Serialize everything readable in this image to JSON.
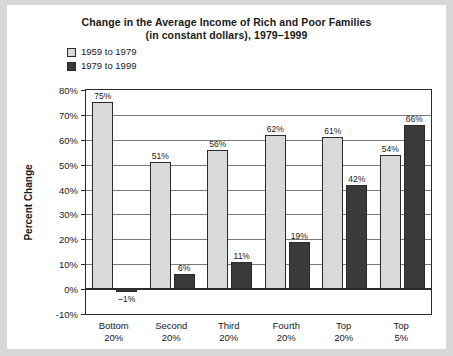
{
  "chart_data": {
    "type": "bar",
    "title": "Change in the Average Income of Rich and Poor Families",
    "subtitle": "(in constant dollars), 1979–1999",
    "xlabel": "",
    "ylabel": "Percent Change",
    "ylim": [
      -10,
      80
    ],
    "ytick_labels": [
      "80%",
      "70%",
      "60%",
      "50%",
      "40%",
      "30%",
      "20%",
      "10%",
      "0%",
      "-10%"
    ],
    "ytick_values": [
      80,
      70,
      60,
      50,
      40,
      30,
      20,
      10,
      0,
      -10
    ],
    "grid": true,
    "legend_position": "top-left",
    "categories": [
      "Bottom 20%",
      "Second 20%",
      "Third 20%",
      "Fourth 20%",
      "Top 20%",
      "Top 5%"
    ],
    "category_lines": [
      [
        "Bottom",
        "20%"
      ],
      [
        "Second",
        "20%"
      ],
      [
        "Third",
        "20%"
      ],
      [
        "Fourth",
        "20%"
      ],
      [
        "Top",
        "20%"
      ],
      [
        "Top",
        "5%"
      ]
    ],
    "series": [
      {
        "name": "1959 to 1979",
        "color": "#d9d9d9",
        "values": [
          75,
          51,
          56,
          62,
          61,
          54
        ],
        "labels": [
          "75%",
          "51%",
          "56%",
          "62%",
          "61%",
          "54%"
        ]
      },
      {
        "name": "1979 to 1999",
        "color": "#3a3a3a",
        "values": [
          -1,
          6,
          11,
          19,
          42,
          66
        ],
        "labels": [
          "–1%",
          "6%",
          "11%",
          "19%",
          "42%",
          "66%"
        ]
      }
    ]
  },
  "legend": {
    "items": [
      {
        "label": "1959 to 1979",
        "swatch": "light"
      },
      {
        "label": "1979 to 1999",
        "swatch": "dark"
      }
    ]
  }
}
